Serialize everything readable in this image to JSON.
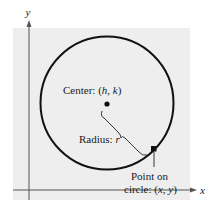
{
  "diagram": {
    "type": "circle-definition",
    "axes": {
      "x_label": "x",
      "y_label": "y"
    },
    "circle": {
      "center_label_prefix": "Center: (",
      "center_h": "h",
      "center_sep": ", ",
      "center_k": "k",
      "center_label_suffix": ")",
      "radius_label_prefix": "Radius: ",
      "radius_symbol": "r",
      "point_label_line1": "Point on",
      "point_label_line2_prefix": "circle: (",
      "point_x": "x",
      "point_sep": ", ",
      "point_y": "y",
      "point_label_line2_suffix": ")"
    },
    "colors": {
      "background_panel": "#eeeeee",
      "stroke": "#111111",
      "axis": "#555555"
    }
  }
}
